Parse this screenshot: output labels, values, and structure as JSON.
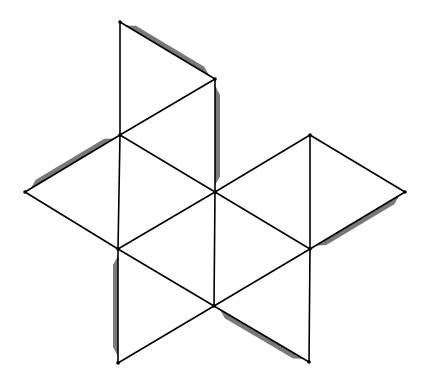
{
  "diagram": {
    "type": "octahedron-net",
    "background": "#ffffff",
    "line_color": "#000000",
    "tab_color": "#6e6e6e",
    "vertices": {
      "A": [
        120,
        22
      ],
      "B": [
        215,
        79
      ],
      "C": [
        120,
        135
      ],
      "D": [
        25,
        192
      ],
      "E": [
        215,
        192
      ],
      "F": [
        310,
        135
      ],
      "G": [
        405,
        192
      ],
      "H": [
        118,
        249
      ],
      "I": [
        310,
        249
      ],
      "J": [
        214,
        306
      ],
      "K": [
        118,
        363
      ],
      "L": [
        309,
        362
      ]
    },
    "faces": [
      [
        "A",
        "B",
        "C"
      ],
      [
        "C",
        "B",
        "E"
      ],
      [
        "D",
        "C",
        "H"
      ],
      [
        "C",
        "E",
        "H"
      ],
      [
        "H",
        "E",
        "J"
      ],
      [
        "E",
        "F",
        "I"
      ],
      [
        "F",
        "G",
        "I"
      ],
      [
        "E",
        "I",
        "J"
      ],
      [
        "H",
        "J",
        "K"
      ],
      [
        "J",
        "I",
        "L"
      ]
    ],
    "edges": [
      [
        "A",
        "B"
      ],
      [
        "A",
        "C"
      ],
      [
        "B",
        "C"
      ],
      [
        "B",
        "E"
      ],
      [
        "C",
        "E"
      ],
      [
        "C",
        "D"
      ],
      [
        "D",
        "H"
      ],
      [
        "C",
        "H"
      ],
      [
        "H",
        "E"
      ],
      [
        "E",
        "J"
      ],
      [
        "H",
        "J"
      ],
      [
        "E",
        "F"
      ],
      [
        "F",
        "I"
      ],
      [
        "E",
        "I"
      ],
      [
        "F",
        "G"
      ],
      [
        "G",
        "I"
      ],
      [
        "I",
        "J"
      ],
      [
        "H",
        "K"
      ],
      [
        "K",
        "J"
      ],
      [
        "J",
        "L"
      ],
      [
        "I",
        "L"
      ]
    ],
    "tabs": [
      {
        "edge": [
          "A",
          "B"
        ],
        "side": "outer"
      },
      {
        "edge": [
          "B",
          "E"
        ],
        "side": "outer"
      },
      {
        "edge": [
          "D",
          "C"
        ],
        "side": "outer"
      },
      {
        "edge": [
          "G",
          "I"
        ],
        "side": "outer"
      },
      {
        "edge": [
          "H",
          "K"
        ],
        "side": "outer"
      },
      {
        "edge": [
          "J",
          "L"
        ],
        "side": "outer"
      }
    ]
  }
}
